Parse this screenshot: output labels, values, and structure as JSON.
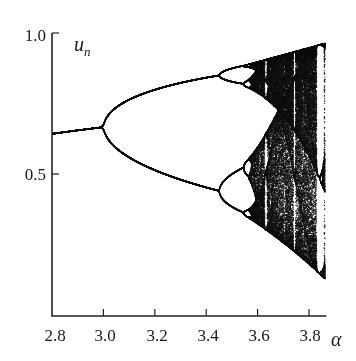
{
  "chart_data": {
    "type": "scatter",
    "title": "",
    "subtitle": "Bifurcation diagram of the logistic map u_{n+1} = α u_n (1 − u_n)",
    "xlabel": "α",
    "ylabel": "u_n",
    "xlim": [
      2.8,
      3.86
    ],
    "ylim": [
      0.0,
      1.0
    ],
    "x_ticks": [
      2.8,
      3.0,
      3.2,
      3.4,
      3.6,
      3.8
    ],
    "x_tick_labels": [
      "2.8",
      "3.0",
      "3.2",
      "3.4",
      "3.6",
      "3.8"
    ],
    "y_ticks": [
      0.5,
      1.0
    ],
    "y_tick_labels": [
      "0.5",
      "1.0"
    ],
    "grid": false,
    "legend": null,
    "point_color": "#111111",
    "key_points": {
      "period_doubling_1": {
        "alpha": 3.0,
        "u": 0.667
      },
      "period_doubling_2": {
        "alpha": 3.449,
        "u_upper": 0.85,
        "u_lower": 0.44
      },
      "onset_of_chaos": {
        "alpha": 3.57
      },
      "fixed_point_at_2_8": {
        "alpha": 2.8,
        "u": 0.643
      },
      "chaotic_band_at_3_85": {
        "alpha": 3.85,
        "u_min": 0.15,
        "u_max": 0.96
      }
    },
    "series": [
      {
        "name": "attractor",
        "model": "logistic",
        "alpha_start": 2.8,
        "alpha_end": 3.86,
        "transient": 300,
        "samples": 140
      }
    ]
  },
  "axes": {
    "x_title": "α",
    "y_title_main": "u",
    "y_title_sub": "n"
  }
}
